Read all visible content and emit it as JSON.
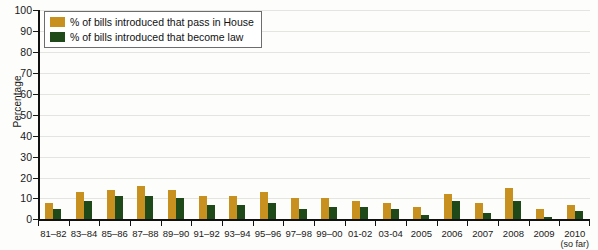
{
  "chart_data": {
    "type": "bar",
    "title": "",
    "xlabel": "",
    "ylabel": "Percentage",
    "ylim": [
      0,
      100
    ],
    "ytick_step": 10,
    "yticks": [
      0,
      10,
      20,
      30,
      40,
      50,
      60,
      70,
      80,
      90,
      100
    ],
    "grid": true,
    "legend_position": "top-left",
    "categories": [
      "81–82",
      "83–84",
      "85–86",
      "87–88",
      "89–90",
      "91–92",
      "93–94",
      "95–96",
      "97–98",
      "99–00",
      "01-02",
      "03-04",
      "2005",
      "2006",
      "2007",
      "2008",
      "2009",
      "2010"
    ],
    "category_sublabels": [
      "",
      "",
      "",
      "",
      "",
      "",
      "",
      "",
      "",
      "",
      "",
      "",
      "",
      "",
      "",
      "",
      "",
      "(so far)"
    ],
    "series": [
      {
        "name": "% of bills introduced that pass in House",
        "color": "#c8901e",
        "values": [
          8,
          13,
          14,
          16,
          14,
          11,
          11,
          13,
          10,
          10,
          9,
          8,
          6,
          12,
          8,
          15,
          5,
          7
        ]
      },
      {
        "name": "% of bills introduced that become law",
        "color": "#20491a",
        "values": [
          5,
          9,
          11,
          11,
          10,
          7,
          7,
          8,
          5,
          6,
          6,
          5,
          2,
          9,
          3,
          9,
          1,
          4
        ]
      }
    ]
  },
  "legend": {
    "entries": [
      {
        "label": "% of bills introduced that pass in House",
        "color": "#c8901e"
      },
      {
        "label": "% of bills introduced that become law",
        "color": "#20491a"
      }
    ]
  },
  "axes": {
    "y_title": "Percentage"
  }
}
